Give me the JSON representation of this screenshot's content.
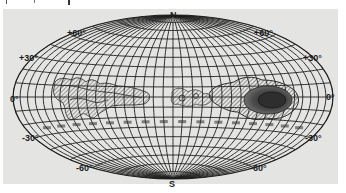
{
  "figure": {
    "projection": "elliptical equal-area (Hammer-Aitoff) galactic grid",
    "pole_labels": {
      "north": "N",
      "south": "S"
    },
    "latitude_labels": {
      "plus60_left": "+60°",
      "plus60_right": "+60°",
      "plus30_left": "+30°",
      "plus30_right": "+30°",
      "zero_left": "0°",
      "zero_right": "0°",
      "minus30_left": "-30°",
      "minus30_right": "-30°",
      "minus60_left": "-60°",
      "minus60_right": "-60°"
    },
    "colors": {
      "background": "#e4e4e2",
      "grid": "#1e1e1e",
      "contour": "#2a2a2a",
      "dense_core": "#3a3a3a"
    },
    "features": [
      {
        "name": "left-contour-region",
        "description": "elongated hatched contour region left of center near equator"
      },
      {
        "name": "center-contour-cluster",
        "description": "small clustered contour blobs near center"
      },
      {
        "name": "right-dense-region",
        "description": "large dense shaded contour region right of center, darkest core"
      }
    ]
  }
}
